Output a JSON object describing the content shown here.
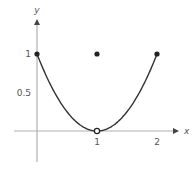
{
  "chart_data": {
    "type": "line",
    "title": "",
    "xlabel": "x",
    "ylabel": "y",
    "xlim": [
      -0.5,
      2.5
    ],
    "ylim": [
      -0.5,
      1.4
    ],
    "grid": false,
    "x_ticks": [
      {
        "value": 1,
        "label": "1"
      },
      {
        "value": 2,
        "label": "2"
      }
    ],
    "y_ticks": [
      {
        "value": 0.5,
        "label": "0.5"
      },
      {
        "value": 1,
        "label": "1"
      }
    ],
    "series": [
      {
        "name": "f(x) = (x-1)^2, x≠1",
        "domain": [
          0,
          2
        ],
        "x": [
          0,
          0.25,
          0.5,
          0.75,
          1,
          1.25,
          1.5,
          1.75,
          2
        ],
        "y": [
          1,
          0.5625,
          0.25,
          0.0625,
          0,
          0.0625,
          0.25,
          0.5625,
          1
        ]
      }
    ],
    "points": [
      {
        "x": 0,
        "y": 1,
        "style": "filled"
      },
      {
        "x": 1,
        "y": 1,
        "style": "filled"
      },
      {
        "x": 2,
        "y": 1,
        "style": "filled"
      },
      {
        "x": 1,
        "y": 0,
        "style": "open"
      }
    ],
    "colors": {
      "curve": "#333333",
      "axis": "#b0b0b0",
      "text": "#555555",
      "point": "#222222"
    }
  }
}
